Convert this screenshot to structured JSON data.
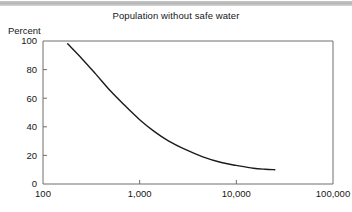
{
  "topbar": {
    "color": "#bfbfbf"
  },
  "chart_data": {
    "type": "line",
    "title": "Population without safe water",
    "xlabel": "",
    "ylabel": "Percent",
    "xscale": "log",
    "yscale": "linear",
    "xlim": [
      100,
      100000
    ],
    "ylim": [
      0,
      100
    ],
    "grid": false,
    "legend": null,
    "xticks": [
      100,
      1000,
      10000,
      100000
    ],
    "xtick_labels": [
      "100",
      "1,000",
      "10,000",
      "100,000"
    ],
    "yticks": [
      0,
      20,
      40,
      60,
      80,
      100
    ],
    "ytick_labels": [
      "0",
      "20",
      "40",
      "60",
      "80",
      "100"
    ],
    "series": [
      {
        "name": "Population without safe water",
        "color": "#1b1b1b",
        "x": [
          180,
          250,
          350,
          500,
          700,
          1000,
          1400,
          2000,
          3000,
          4500,
          7000,
          10000,
          15000,
          20000,
          25000
        ],
        "y": [
          98,
          88,
          77,
          65,
          55,
          45,
          37,
          30,
          24,
          19,
          15,
          13,
          11,
          10.3,
          10
        ]
      }
    ]
  }
}
